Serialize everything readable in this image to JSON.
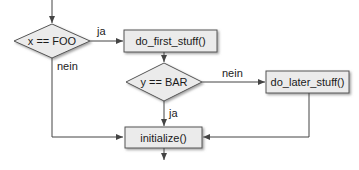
{
  "diagram": {
    "type": "flowchart",
    "colors": {
      "node_fill": "#ebebeb",
      "node_stroke": "#555555",
      "line": "#444444",
      "shadow": "#9a9a9a"
    },
    "nodes": {
      "decision_x": {
        "label": "x == FOO",
        "shape": "diamond"
      },
      "do_first": {
        "label": "do_first_stuff()",
        "shape": "box"
      },
      "decision_y": {
        "label": "y == BAR",
        "shape": "diamond"
      },
      "do_later": {
        "label": "do_later_stuff()",
        "shape": "box"
      },
      "initialize": {
        "label": "initialize()",
        "shape": "box"
      }
    },
    "edges": {
      "x_yes": {
        "from": "decision_x",
        "to": "do_first",
        "label": "ja"
      },
      "x_no": {
        "from": "decision_x",
        "to": "initialize",
        "label": "nein"
      },
      "first_to_y": {
        "from": "do_first",
        "to": "decision_y",
        "label": ""
      },
      "y_no": {
        "from": "decision_y",
        "to": "do_later",
        "label": "nein"
      },
      "y_yes": {
        "from": "decision_y",
        "to": "initialize",
        "label": "ja"
      },
      "later_to_init": {
        "from": "do_later",
        "to": "initialize",
        "label": ""
      }
    }
  }
}
